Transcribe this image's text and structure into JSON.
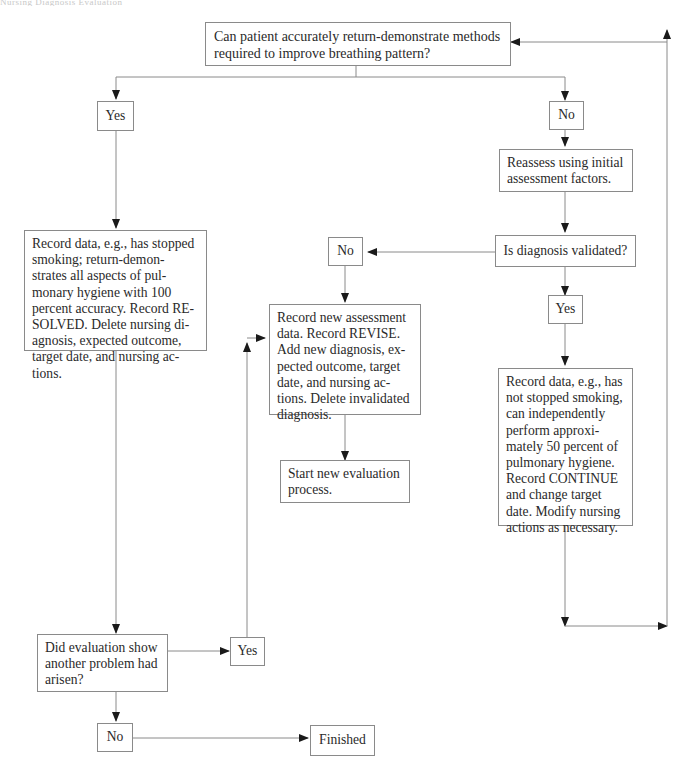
{
  "header": {
    "faint_text": "Nursing Diagnosis Evaluation"
  },
  "nodes": {
    "start_question": {
      "text": "Can patient accurately return-demonstrate methods required to improve breathing pattern?"
    },
    "yes_top": {
      "text": "Yes"
    },
    "no_top": {
      "text": "No"
    },
    "reassess": {
      "text": "Reassess using initial assessment factors."
    },
    "diagnosis_validated": {
      "text": "Is diagnosis validated?"
    },
    "no_middle": {
      "text": "No"
    },
    "yes_right": {
      "text": "Yes"
    },
    "resolved": {
      "text": "Record data, e.g., has stopped smoking; return-demon-strates all aspects of pul-monary hygiene with 100 percent accuracy. Record RE-SOLVED. Delete nursing di-agnosis, expected outcome, target date, and nursing ac-tions."
    },
    "revise": {
      "text": "Record new assessment data. Record REVISE. Add new diagnosis, ex-pected outcome, target date, and nursing ac-tions. Delete invalidated diagnosis."
    },
    "new_evaluation": {
      "text": "Start new evaluation process."
    },
    "continue": {
      "text": "Record data, e.g., has not stopped smoking, can independently perform approxi-mately 50 percent of pulmonary hygiene. Record CONTINUE and change target date. Modify nursing actions as necessary."
    },
    "another_problem": {
      "text": "Did evaluation show another problem had arisen?"
    },
    "yes_bottom": {
      "text": "Yes"
    },
    "no_bottom": {
      "text": "No"
    },
    "finished": {
      "text": "Finished"
    }
  },
  "edges": [
    {
      "from": "start_question",
      "to": "yes_top"
    },
    {
      "from": "start_question",
      "to": "no_top"
    },
    {
      "from": "yes_top",
      "to": "resolved"
    },
    {
      "from": "no_top",
      "to": "reassess"
    },
    {
      "from": "reassess",
      "to": "diagnosis_validated"
    },
    {
      "from": "diagnosis_validated",
      "to": "no_middle"
    },
    {
      "from": "diagnosis_validated",
      "to": "yes_right"
    },
    {
      "from": "no_middle",
      "to": "revise"
    },
    {
      "from": "revise",
      "to": "new_evaluation"
    },
    {
      "from": "yes_right",
      "to": "continue"
    },
    {
      "from": "continue",
      "to": "start_question",
      "label": "loop back"
    },
    {
      "from": "resolved",
      "to": "another_problem"
    },
    {
      "from": "another_problem",
      "to": "yes_bottom"
    },
    {
      "from": "yes_bottom",
      "to": "revise"
    },
    {
      "from": "another_problem",
      "to": "no_bottom"
    },
    {
      "from": "no_bottom",
      "to": "finished"
    }
  ],
  "colors": {
    "line": "#8a8a8a",
    "arrow": "#1a1a1a",
    "text": "#2a2a2a"
  }
}
